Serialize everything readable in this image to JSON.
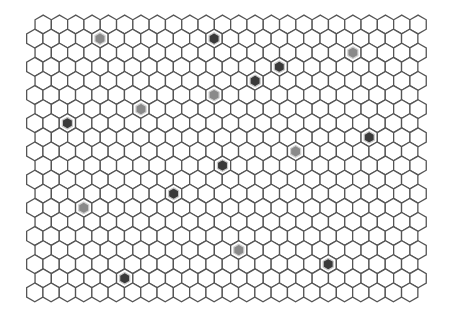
{
  "board": {
    "title": "hex grid board",
    "rows": 20,
    "cols": 24,
    "orientation": "pointy-top",
    "hex_width": 16.3,
    "hex_height": 18.8,
    "row_pitch": 14.1,
    "origin_y": 24.5,
    "even_row_x0": 43.2,
    "odd_row_x0": 34.8,
    "colors": {
      "background": "#ffffff",
      "cell_fill": "#ffffff",
      "cell_stroke": "#555555",
      "token_medium": "#8a8a8a",
      "token_dark": "#3a3a3a",
      "token_ring": "#d0d0d0"
    },
    "filled_cells": [
      {
        "row": 1,
        "col": 4,
        "shade": "medium"
      },
      {
        "row": 1,
        "col": 11,
        "shade": "dark"
      },
      {
        "row": 2,
        "col": 19,
        "shade": "medium"
      },
      {
        "row": 3,
        "col": 15,
        "shade": "dark"
      },
      {
        "row": 4,
        "col": 13,
        "shade": "dark"
      },
      {
        "row": 5,
        "col": 11,
        "shade": "medium"
      },
      {
        "row": 6,
        "col": 6,
        "shade": "medium"
      },
      {
        "row": 7,
        "col": 2,
        "shade": "dark"
      },
      {
        "row": 8,
        "col": 20,
        "shade": "dark"
      },
      {
        "row": 9,
        "col": 16,
        "shade": "medium"
      },
      {
        "row": 10,
        "col": 11,
        "shade": "dark"
      },
      {
        "row": 12,
        "col": 8,
        "shade": "dark"
      },
      {
        "row": 13,
        "col": 3,
        "shade": "medium"
      },
      {
        "row": 16,
        "col": 12,
        "shade": "medium"
      },
      {
        "row": 17,
        "col": 18,
        "shade": "dark"
      },
      {
        "row": 18,
        "col": 5,
        "shade": "dark"
      }
    ]
  }
}
